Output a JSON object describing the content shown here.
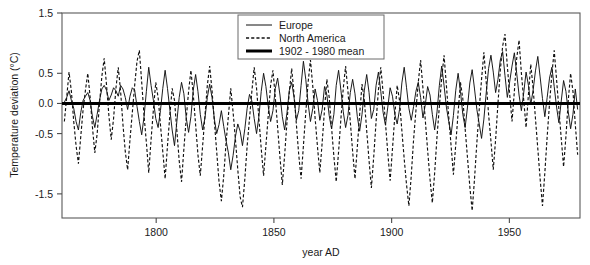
{
  "figure": {
    "background": "#ffffff",
    "ink_color": "#101010"
  },
  "chart_data": {
    "type": "line",
    "title": "",
    "subtitle": "",
    "xlabel": "year AD",
    "ylabel": "Temperature deviation (°C)",
    "xlim": [
      1760,
      1980
    ],
    "ylim": [
      -1.9,
      1.5
    ],
    "grid": false,
    "legend_position": "top-center-right",
    "x_ticks": [
      1800,
      1850,
      1900,
      1950
    ],
    "x_tick_labels": [
      "1800",
      "1850",
      "1900",
      "1950"
    ],
    "y_ticks": [
      1.5,
      0.5,
      0.0,
      -0.5,
      -1.5
    ],
    "y_tick_labels": [
      "1.5",
      "0.5",
      "0.0",
      "-0.5",
      "-1.5"
    ],
    "annotations": [],
    "series": [
      {
        "name": "Europe",
        "style": "solid-thin",
        "x_start": 1761,
        "x_end": 1979,
        "values": [
          0.02,
          0.1,
          0.21,
          0.05,
          -0.08,
          -0.3,
          -0.44,
          -0.15,
          0.05,
          0.12,
          0.18,
          0.05,
          -0.22,
          -0.4,
          -0.18,
          0.05,
          0.24,
          0.3,
          0.22,
          0.05,
          0.14,
          0.26,
          0.21,
          0.12,
          0.3,
          0.24,
          0.1,
          -0.1,
          0.12,
          0.26,
          0.22,
          -0.05,
          -0.3,
          -0.52,
          -0.22,
          0.2,
          0.6,
          0.3,
          0.05,
          -0.25,
          -0.4,
          -0.12,
          0.25,
          0.55,
          0.25,
          -0.1,
          -0.44,
          -0.7,
          -0.3,
          0.1,
          0.35,
          0.16,
          -0.24,
          -0.48,
          -0.22,
          0.22,
          0.48,
          0.2,
          -0.18,
          -0.44,
          -0.24,
          0.1,
          0.32,
          0.1,
          -0.26,
          -0.5,
          -0.35,
          -0.12,
          -0.38,
          -0.62,
          -0.82,
          -1.1,
          -0.86,
          -0.55,
          -0.34,
          -0.46,
          -0.7,
          -0.42,
          -0.08,
          0.15,
          0.04,
          -0.25,
          -0.5,
          -0.22,
          0.2,
          0.5,
          0.28,
          -0.05,
          -0.3,
          -0.12,
          0.25,
          0.42,
          0.14,
          -0.22,
          -0.44,
          -0.15,
          0.22,
          0.35,
          0.1,
          -0.28,
          -0.12,
          0.3,
          0.7,
          0.4,
          0.0,
          -0.3,
          -0.08,
          0.24,
          0.05,
          -0.28,
          -0.1,
          0.28,
          0.14,
          -0.2,
          -0.42,
          -0.18,
          0.3,
          0.55,
          0.22,
          -0.14,
          -0.4,
          -0.2,
          0.18,
          0.4,
          0.16,
          -0.22,
          -0.46,
          -0.18,
          0.22,
          0.48,
          0.18,
          -0.25,
          -0.1,
          0.3,
          0.52,
          0.2,
          -0.15,
          -0.36,
          -0.06,
          0.26,
          0.12,
          -0.18,
          -0.34,
          -0.1,
          0.34,
          0.6,
          0.26,
          -0.08,
          -0.28,
          -0.05,
          0.2,
          0.35,
          0.1,
          -0.24,
          -0.02,
          0.28,
          0.14,
          -0.18,
          -0.44,
          -0.14,
          0.3,
          0.62,
          0.3,
          -0.06,
          -0.3,
          -0.52,
          -0.2,
          0.22,
          0.5,
          0.2,
          -0.18,
          -0.4,
          -0.06,
          0.34,
          0.56,
          0.24,
          -0.1,
          -0.34,
          -0.58,
          -0.26,
          0.18,
          0.58,
          0.8,
          0.52,
          0.18,
          0.4,
          0.72,
          0.86,
          0.46,
          0.1,
          0.36,
          0.62,
          0.84,
          0.5,
          0.14,
          -0.12,
          0.18,
          0.52,
          0.3,
          -0.02,
          0.22,
          0.54,
          0.78,
          0.44,
          0.08,
          -0.22,
          0.1,
          0.42,
          0.6,
          0.28,
          -0.06,
          -0.32,
          0.04,
          0.38,
          0.2,
          -0.14,
          -0.42,
          -0.18,
          0.24,
          -0.1
        ]
      },
      {
        "name": "North America",
        "style": "dashed",
        "x_start": 1761,
        "x_end": 1979,
        "values": [
          -0.3,
          0.1,
          0.52,
          0.2,
          -0.3,
          -0.7,
          -1.0,
          -0.55,
          -0.1,
          0.22,
          0.5,
          0.1,
          -0.4,
          -0.82,
          -0.5,
          0.0,
          0.45,
          0.75,
          0.3,
          -0.2,
          -0.6,
          -0.25,
          0.25,
          0.6,
          0.2,
          -0.35,
          -0.8,
          -1.1,
          -0.6,
          -0.15,
          0.3,
          0.7,
          0.88,
          0.35,
          -0.2,
          -0.65,
          -1.15,
          -0.6,
          -0.1,
          0.35,
          0.1,
          -0.35,
          -0.8,
          -1.25,
          -0.7,
          -0.2,
          0.25,
          0.05,
          -0.45,
          -0.95,
          -1.3,
          -0.75,
          -0.25,
          0.2,
          0.55,
          0.15,
          -0.35,
          -0.85,
          -1.2,
          -0.7,
          -0.2,
          0.3,
          0.62,
          0.22,
          -0.3,
          -0.8,
          -1.3,
          -1.62,
          -1.2,
          -0.65,
          -0.2,
          0.25,
          -0.15,
          -0.6,
          -1.1,
          -1.55,
          -1.72,
          -1.25,
          -0.7,
          -0.25,
          0.2,
          0.6,
          0.25,
          -0.25,
          -0.75,
          -1.2,
          -0.7,
          -0.2,
          0.3,
          0.55,
          0.1,
          -0.4,
          -0.9,
          -1.35,
          -0.85,
          -0.3,
          0.2,
          0.58,
          0.15,
          -0.35,
          -0.85,
          -1.25,
          -0.7,
          -0.15,
          0.35,
          0.72,
          0.28,
          -0.25,
          -0.72,
          -1.15,
          -0.65,
          -0.1,
          0.4,
          0.1,
          -0.4,
          -0.88,
          -1.3,
          -0.8,
          -0.25,
          0.25,
          0.62,
          0.2,
          -0.3,
          -0.8,
          -1.25,
          -0.72,
          -0.18,
          0.32,
          0.05,
          -0.45,
          -0.95,
          -1.4,
          -0.88,
          -0.3,
          0.22,
          0.6,
          0.18,
          -0.32,
          -0.82,
          -1.28,
          -0.75,
          -0.2,
          0.3,
          0.05,
          -0.45,
          -0.92,
          -1.35,
          -1.7,
          -1.2,
          -0.6,
          -0.12,
          0.35,
          0.72,
          0.25,
          -0.28,
          -0.78,
          -1.25,
          -1.65,
          -1.15,
          -0.55,
          -0.05,
          0.42,
          0.8,
          0.3,
          -0.22,
          -0.7,
          -1.18,
          -0.68,
          -0.15,
          0.35,
          0.08,
          -0.42,
          -0.9,
          -1.38,
          -1.78,
          -1.25,
          -0.65,
          -0.1,
          0.4,
          0.85,
          0.35,
          -0.18,
          -0.62,
          -1.1,
          -0.6,
          0.0,
          0.55,
          0.95,
          1.15,
          0.62,
          0.15,
          -0.3,
          0.2,
          0.75,
          1.05,
          0.5,
          0.05,
          -0.4,
          0.15,
          0.65,
          0.25,
          -0.25,
          -0.75,
          -1.25,
          -1.7,
          -1.15,
          -0.55,
          0.0,
          0.48,
          0.88,
          0.4,
          -0.1,
          -0.58,
          -1.05,
          -0.55,
          0.05,
          0.5,
          0.2,
          -0.35,
          -0.85
        ]
      },
      {
        "name": "1902 - 1980 mean",
        "style": "thick-solid-reference",
        "value": 0.0
      }
    ]
  },
  "legend": {
    "entries": [
      {
        "label": "Europe",
        "swatch": "solid-thin-line"
      },
      {
        "label": "North America",
        "swatch": "dashed-line"
      },
      {
        "label": "1902 - 1980 mean",
        "swatch": "thick-solid-line"
      }
    ]
  }
}
